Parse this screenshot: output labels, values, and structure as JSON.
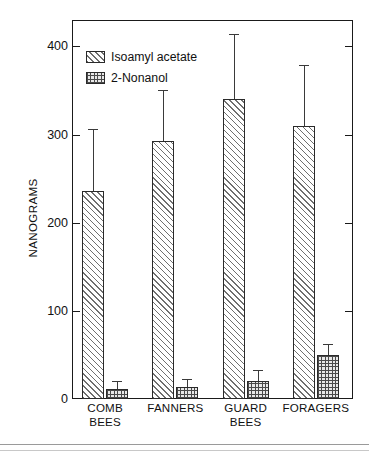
{
  "chart_data": {
    "type": "bar",
    "title": "",
    "xlabel": "",
    "ylabel": "NANOGRAMS",
    "ylim": [
      0,
      430
    ],
    "yticks": [
      0,
      100,
      200,
      300,
      400
    ],
    "ytick_labels": [
      "0",
      "100",
      "200",
      "300",
      "400"
    ],
    "grid": false,
    "legend_position": "top-left",
    "categories": [
      "COMB\nBEES",
      "FANNERS",
      "GUARD\nBEES",
      "FORAGERS"
    ],
    "category_labels_flat": [
      "COMB BEES",
      "FANNERS",
      "GUARD BEES",
      "FORAGERS"
    ],
    "series": [
      {
        "name": "Isoamyl acetate",
        "pattern": "diagonal-hatch",
        "values": [
          236,
          293,
          340,
          310
        ],
        "errors_upper": [
          306,
          351,
          414,
          379
        ]
      },
      {
        "name": "2-Nonanol",
        "pattern": "cross-hatch",
        "values": [
          11,
          14,
          20,
          50
        ],
        "errors_upper": [
          20,
          23,
          33,
          62
        ]
      }
    ]
  },
  "legend": {
    "items": [
      {
        "label": "Isoamyl acetate",
        "swatch": "diagonal-hatch-swatch"
      },
      {
        "label": "2-Nonanol",
        "swatch": "cross-hatch-swatch"
      }
    ]
  },
  "axes": {
    "y_title": "NANOGRAMS"
  },
  "colors": {
    "frame": "#1a1a1a",
    "bar_outline": "#2a2a2a",
    "hatch": "#6f6f6f",
    "text": "#111111"
  }
}
